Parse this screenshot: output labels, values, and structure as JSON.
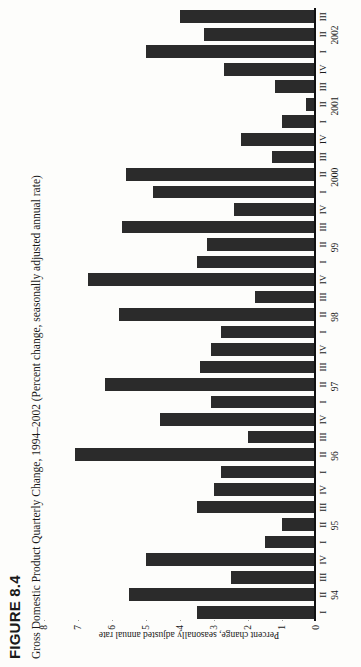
{
  "figure": {
    "number": "FIGURE 8.4",
    "title": "Gross Domestic Product Quarterly Change, 1994–2002 (Percent change, seasonally adjusted annual rate)"
  },
  "chart_data": {
    "type": "bar",
    "title": "Gross Domestic Product Quarterly Change, 1994–2002 (Percent change, seasonally adjusted annual rate)",
    "xlabel": "",
    "ylabel": "Percent change, seasonally adjusted annual rate",
    "ylim": [
      0,
      8
    ],
    "yticks": [
      "0",
      "1",
      "2",
      "3",
      "4",
      "5",
      "6",
      "7",
      "8"
    ],
    "grid": true,
    "legend": "none",
    "orientation": "rotated-90-ccw",
    "categories": [
      "I",
      "II",
      "III",
      "IV",
      "I",
      "II",
      "III",
      "IV",
      "I",
      "II",
      "III",
      "IV",
      "I",
      "II",
      "III",
      "IV",
      "I",
      "II",
      "III",
      "IV",
      "I",
      "II",
      "III",
      "IV",
      "I",
      "II",
      "III",
      "IV",
      "I",
      "II",
      "III",
      "IV",
      "I",
      "II",
      "III"
    ],
    "year_labels": [
      {
        "label": "94",
        "index": 1
      },
      {
        "label": "95",
        "index": 5
      },
      {
        "label": "96",
        "index": 9
      },
      {
        "label": "97",
        "index": 13
      },
      {
        "label": "98",
        "index": 17
      },
      {
        "label": "99",
        "index": 21
      },
      {
        "label": "2000",
        "index": 25
      },
      {
        "label": "2001",
        "index": 29
      },
      {
        "label": "2002",
        "index": 33
      }
    ],
    "values": [
      3.5,
      5.5,
      2.5,
      5.0,
      1.5,
      1.0,
      3.5,
      3.0,
      2.8,
      7.1,
      2.0,
      4.6,
      3.1,
      6.2,
      3.4,
      3.1,
      2.8,
      5.8,
      1.8,
      6.7,
      3.5,
      3.2,
      5.7,
      2.4,
      4.8,
      5.6,
      1.3,
      2.2,
      1.0,
      0.3,
      1.2,
      2.7,
      5.0,
      3.3,
      4.0
    ]
  }
}
